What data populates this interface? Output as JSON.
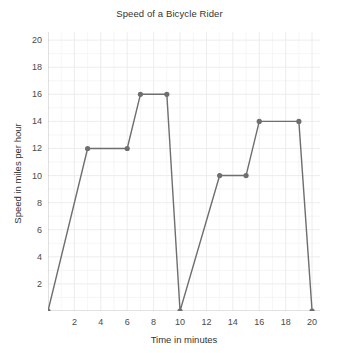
{
  "chart_data": {
    "type": "line",
    "title": "Speed of a Bicycle Rider",
    "xlabel": "Time in minutes",
    "ylabel": "Speed in miles per hour",
    "xlim": [
      0,
      20.6
    ],
    "ylim": [
      0,
      20.6
    ],
    "xticks": [
      2,
      4,
      6,
      8,
      10,
      12,
      14,
      16,
      18,
      20
    ],
    "yticks": [
      2,
      4,
      6,
      8,
      10,
      12,
      14,
      16,
      18,
      20
    ],
    "xtick_labels": [
      "2",
      "4",
      "6",
      "8",
      "10",
      "12",
      "14",
      "16",
      "18",
      "20"
    ],
    "ytick_labels": [
      "2",
      "4",
      "6",
      "8",
      "10",
      "12",
      "14",
      "16",
      "18",
      "20"
    ],
    "grid": true,
    "minor_grid": true,
    "legend": null,
    "series": [
      {
        "name": "Speed",
        "marker": "circle",
        "color": "#6e6e6e",
        "x": [
          0,
          3,
          6,
          7,
          9,
          10,
          13,
          15,
          16,
          19,
          20
        ],
        "y": [
          0,
          12,
          12,
          16,
          16,
          0,
          10,
          10,
          14,
          14,
          0
        ],
        "points": [
          {
            "x": 0,
            "y": 0
          },
          {
            "x": 3,
            "y": 12
          },
          {
            "x": 6,
            "y": 12
          },
          {
            "x": 7,
            "y": 16
          },
          {
            "x": 9,
            "y": 16
          },
          {
            "x": 10,
            "y": 0
          },
          {
            "x": 13,
            "y": 10
          },
          {
            "x": 15,
            "y": 10
          },
          {
            "x": 16,
            "y": 14
          },
          {
            "x": 19,
            "y": 14
          },
          {
            "x": 20,
            "y": 0
          }
        ]
      }
    ]
  },
  "style": {
    "line_color": "#6e6e6e",
    "marker_color": "#6e6e6e",
    "grid_color": "#eceaea",
    "minor_grid_color": "#f4f2f2",
    "text_color": "#333333",
    "tick_color": "#4a4a4a",
    "background": "#ffffff"
  }
}
